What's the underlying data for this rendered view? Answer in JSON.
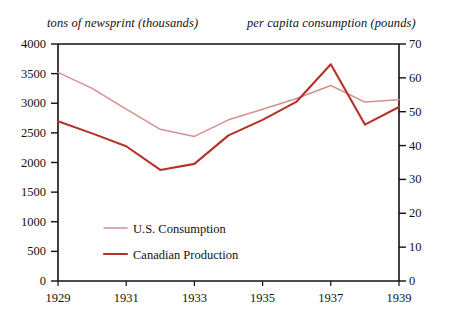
{
  "chart_data": {
    "type": "line",
    "title": "",
    "left_axis": {
      "caption": "tons of newsprint (thousands)",
      "ticks": [
        "0",
        "500",
        "1000",
        "1500",
        "2000",
        "2500",
        "3000",
        "3500",
        "4000"
      ],
      "min": 0,
      "max": 4000,
      "step": 500,
      "label": "tons of newsprint (thousands)"
    },
    "right_axis": {
      "caption": "per capita consumption (pounds)",
      "ticks": [
        "0",
        "10",
        "20",
        "30",
        "40",
        "50",
        "60",
        "70"
      ],
      "min": 0,
      "max": 70,
      "step": 10,
      "label": "per capita consumption (pounds)"
    },
    "xlabel": "",
    "x": [
      1929,
      1930,
      1931,
      1932,
      1933,
      1934,
      1935,
      1936,
      1937,
      1938,
      1939
    ],
    "xticks": [
      "1929",
      "1931",
      "1933",
      "1935",
      "1937",
      "1939"
    ],
    "xlim": [
      1929,
      1939
    ],
    "grid": false,
    "legend_position": "inside-lower-left",
    "series": [
      {
        "name": "U.S. Consumption",
        "axis": "left",
        "color": "#d4918f",
        "values": [
          3520,
          3250,
          2900,
          2560,
          2440,
          2720,
          2900,
          3080,
          3300,
          3020,
          3060
        ]
      },
      {
        "name": "Canadian Production",
        "axis": "right",
        "color": "#b63229",
        "values": [
          47.2,
          43.6,
          39.8,
          32.8,
          34.6,
          43.0,
          47.6,
          53.0,
          64.0,
          46.2,
          51.4
        ]
      }
    ]
  },
  "legend": {
    "items": [
      {
        "label": "U.S. Consumption",
        "color": "#d4918f"
      },
      {
        "label": "Canadian Production",
        "color": "#b63229"
      }
    ]
  }
}
